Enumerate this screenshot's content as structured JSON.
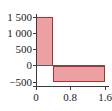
{
  "chart_data": {
    "type": "bar",
    "title": "",
    "title_note": "clipped/illegible title fragment at top edge",
    "xlabel": "",
    "ylabel": "",
    "xlim": [
      0,
      1.6
    ],
    "ylim": [
      -500,
      1500
    ],
    "grid": false,
    "legend": null,
    "x_ticks": [
      "0",
      "0.8",
      "1.6"
    ],
    "x_tick_values": [
      0,
      0.8,
      1.6
    ],
    "y_ticks": [
      "1 500",
      "1 000",
      "500",
      "0",
      "−500"
    ],
    "y_tick_values": [
      1500,
      1000,
      500,
      0,
      -500
    ],
    "bars": [
      {
        "x_start": 0,
        "x_end": 0.4,
        "value": 1500
      },
      {
        "x_start": 0.4,
        "x_end": 1.6,
        "value": -500
      }
    ],
    "colors": {
      "bar_fill": "#eda0a4",
      "bar_edge": "#b03030",
      "axis": "#3b3b3b",
      "background": "#ffffff"
    }
  }
}
